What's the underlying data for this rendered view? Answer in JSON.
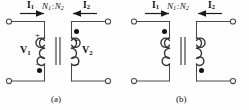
{
  "figure": {
    "background_color": "#fefefe",
    "wire_color": "#4a4a4a",
    "text_color": "#111111"
  },
  "panel_a": {
    "caption": "(a)",
    "current_left": {
      "symbol": "I",
      "subscript": "1",
      "direction": "right"
    },
    "current_right": {
      "symbol": "I",
      "subscript": "2",
      "direction": "left"
    },
    "turns_ratio": {
      "primary": "N",
      "primary_sub": "1",
      "separator": ":",
      "secondary": "N",
      "secondary_sub": "2"
    },
    "voltage_left": {
      "symbol": "V",
      "subscript": "1"
    },
    "voltage_right": {
      "symbol": "V",
      "subscript": "2"
    },
    "polarity_left_top": "+",
    "polarity_left_bottom": "−",
    "polarity_right_top": "+",
    "polarity_right_bottom": "−",
    "dot_left_position": "bottom",
    "dot_right_position": "top"
  },
  "panel_b": {
    "caption": "(b)",
    "current_left": {
      "symbol": "I",
      "subscript": "1",
      "direction": "right"
    },
    "current_right": {
      "symbol": "I",
      "subscript": "2",
      "direction": "left"
    },
    "turns_ratio": {
      "primary": "N",
      "primary_sub": "1",
      "separator": ":",
      "secondary": "N",
      "secondary_sub": "2"
    },
    "dot_left_position": "top",
    "dot_right_position": "bottom"
  }
}
